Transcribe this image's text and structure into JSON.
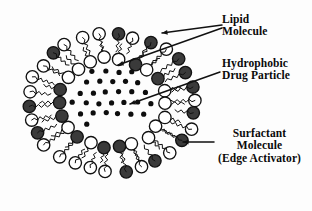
{
  "figure": {
    "background_color": "#fdfdfd",
    "ink_color": "#111111"
  },
  "labels": {
    "lipid": {
      "name": "Lipid Molecule",
      "line1": "Lipid",
      "line2": "Molecule"
    },
    "hydrophobic": {
      "name": "Hydrophobic Drug Particle",
      "line1": "Hydrophobic",
      "line2": "Drug Particle"
    },
    "surfactant": {
      "name": "Surfactant Molecule (Edge Activator)",
      "line1": "Surfactant",
      "line2": "Molecule",
      "line3": "(Edge Activator)"
    }
  },
  "vesicle": {
    "center_x": 112,
    "center_y": 103,
    "outer_head_ring_radius": 88,
    "inner_head_ring_radius": 56,
    "head_radius": 6.2,
    "outer_head_count": 30,
    "inner_head_count": 22,
    "head_colors": {
      "lipid_dark": "#3a3a3a",
      "surfactant_white": "#ffffff",
      "outline": "#111111"
    },
    "tail_style": "wavy-zigzag",
    "drug_particle": {
      "color": "#0d0d0d",
      "radius": 2.6,
      "count": 29
    }
  },
  "leaders": {
    "lipid_a": {
      "from_x": 222,
      "from_y": 25,
      "to_x": 162,
      "to_y": 33
    },
    "lipid_b": {
      "from_x": 222,
      "from_y": 28,
      "to_x": 118,
      "to_y": 65
    },
    "hydrophobic": {
      "from_x": 220,
      "from_y": 72,
      "to_x": 130,
      "to_y": 104
    },
    "surfactant": {
      "from_x": 214,
      "from_y": 142,
      "to_x": 183,
      "to_y": 142
    }
  }
}
